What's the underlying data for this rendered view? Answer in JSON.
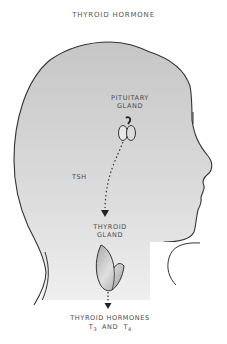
{
  "title": "THYROID HORMONE",
  "labels": {
    "pituitary_line1": "PITUITARY",
    "pituitary_line2": "GLAND",
    "tsh": "TSH",
    "thyroid_line1": "THYROID",
    "thyroid_line2": "GLAND",
    "hormones_line1": "THYROID HORMONES",
    "t_letter_a": "T",
    "t_sub_a": "3",
    "and": "AND",
    "t_letter_b": "T",
    "t_sub_b": "4"
  },
  "colors": {
    "head_fill_top": "#c9c9c9",
    "head_fill_bottom": "#f4f4f4",
    "outline": "#333333",
    "gland_fill": "#bdbdbd"
  }
}
